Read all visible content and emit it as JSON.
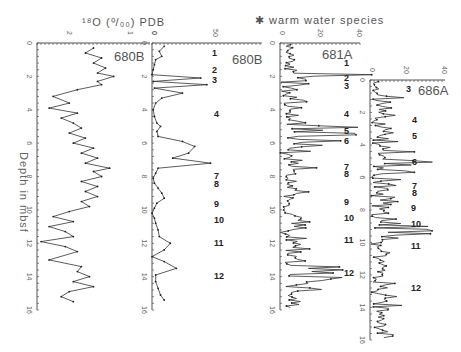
{
  "figure": {
    "title_left": "¹⁸O (⁰/₀₀) PDB",
    "title_right": "✱ warm water species",
    "ylabel": "Depth in mbsf",
    "events": [
      "1",
      "2",
      "3",
      "4",
      "5",
      "6",
      "7",
      "8",
      "9",
      "10",
      "11",
      "12"
    ]
  },
  "chart_data": [
    {
      "type": "line",
      "panel": "680B δ18O",
      "title": "δ18O (‰) PDB",
      "site_label": "680B",
      "xlabel": "δ18O (‰ PDB)",
      "ylabel": "Depth in mbsf",
      "x_ticks": [
        "2",
        "1"
      ],
      "xlim": [
        3,
        0.2
      ],
      "y_ticks": [
        0,
        2,
        4,
        6,
        8,
        10,
        12,
        14,
        16
      ],
      "ylim": [
        0,
        16
      ],
      "y_inverted": true,
      "grid": false,
      "depth": [
        0.3,
        0.6,
        0.9,
        1.2,
        1.5,
        1.8,
        2.0,
        2.3,
        2.5,
        2.8,
        3.2,
        3.6,
        3.9,
        4.2,
        4.5,
        4.8,
        5.1,
        5.4,
        5.7,
        6.0,
        6.3,
        6.6,
        6.9,
        7.2,
        7.5,
        7.7,
        8.0,
        8.3,
        8.6,
        8.9,
        9.2,
        9.5,
        9.8,
        10.1,
        10.4,
        10.7,
        11.0,
        11.3,
        11.6,
        11.9,
        12.2,
        12.5,
        13.0,
        13.4,
        13.7,
        14.0,
        14.3,
        14.6,
        14.9,
        15.2,
        15.5
      ],
      "values": [
        1.6,
        1.8,
        1.4,
        1.6,
        1.3,
        1.5,
        1.1,
        1.5,
        1.4,
        2.0,
        2.6,
        2.2,
        2.7,
        2.0,
        2.4,
        2.1,
        1.9,
        2.2,
        1.8,
        2.1,
        1.6,
        1.9,
        1.5,
        1.8,
        1.2,
        1.6,
        1.4,
        1.9,
        1.5,
        1.8,
        1.5,
        1.9,
        1.7,
        2.2,
        2.6,
        2.1,
        2.7,
        2.3,
        2.1,
        2.9,
        2.3,
        2.0,
        2.7,
        1.9,
        2.0,
        1.7,
        2.1,
        1.6,
        2.2,
        2.4,
        2.1
      ]
    },
    {
      "type": "line",
      "panel": "680B warm water species",
      "site_label": "680B",
      "xlabel": "warm water species (%)",
      "x_ticks": [
        0,
        50
      ],
      "xlim": [
        0,
        50
      ],
      "ylim": [
        0,
        16
      ],
      "y_inverted": true,
      "depth": [
        0.2,
        0.5,
        0.8,
        1.0,
        1.3,
        1.6,
        1.9,
        2.1,
        2.3,
        2.5,
        2.7,
        3.0,
        3.3,
        3.6,
        4.0,
        4.4,
        4.8,
        5.0,
        5.3,
        5.6,
        5.9,
        6.2,
        6.6,
        6.9,
        7.2,
        7.5,
        7.8,
        8.1,
        8.4,
        8.7,
        9.0,
        9.3,
        9.6,
        9.9,
        10.2,
        10.5,
        10.8,
        11.2,
        11.6,
        12.0,
        12.4,
        12.8,
        13.1,
        13.5,
        13.9,
        14.3,
        14.7,
        15.1,
        15.4
      ],
      "values": [
        10,
        6,
        8,
        3,
        2,
        1,
        0,
        40,
        1,
        45,
        2,
        25,
        8,
        3,
        1,
        2,
        4,
        7,
        4,
        5,
        25,
        35,
        30,
        17,
        48,
        5,
        3,
        1,
        2,
        5,
        8,
        10,
        4,
        2,
        0,
        2,
        3,
        5,
        6,
        15,
        10,
        0,
        10,
        20,
        3,
        3,
        5,
        7,
        10
      ]
    },
    {
      "type": "line",
      "panel": "681A warm water species",
      "site_label": "681A",
      "xlabel": "warm water species (%)",
      "x_ticks": [
        0,
        20,
        40
      ],
      "xlim": [
        0,
        40
      ],
      "ylim": [
        0,
        16
      ],
      "y_inverted": true,
      "note": "high-resolution record, values estimated 0–35%, peaks near events 2 (~2 m), 5–6 (~5–6 m), 12 (~14 m)"
    },
    {
      "type": "line",
      "panel": "686A warm water species",
      "site_label": "686A",
      "xlabel": "warm water species (%)",
      "x_ticks": [
        0,
        20,
        40
      ],
      "xlim": [
        0,
        40
      ],
      "y_ticks": [
        0,
        2,
        4,
        6,
        8,
        10,
        12,
        14,
        16
      ],
      "ylim": [
        0,
        16
      ],
      "y_inverted": true,
      "note": "high-resolution record, values estimated 0–35%, peaks near 4.5–5 m and ~9 m"
    }
  ]
}
